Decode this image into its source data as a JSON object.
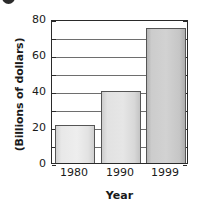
{
  "chart_data": {
    "type": "bar",
    "title": "",
    "xlabel": "Year",
    "ylabel": "(Billions of dollars)",
    "categories": [
      "1980",
      "1990",
      "1999"
    ],
    "values": [
      21,
      40,
      75
    ],
    "ylim": [
      0,
      80
    ],
    "xlim_note": "categorical",
    "y_major_ticks": [
      0,
      20,
      40,
      60,
      80
    ],
    "y_minor_ticks": [
      10,
      30,
      50,
      70
    ],
    "y_tick_labels": [
      "0",
      "20",
      "40",
      "60",
      "80"
    ],
    "gridlines": "horizontal every 10 units",
    "legend": "none",
    "series": [
      {
        "name": "Billions of dollars",
        "values": [
          21,
          40,
          75
        ]
      }
    ],
    "bar_styles": [
      "light-gray",
      "light-gray",
      "medium-gray"
    ]
  },
  "axes": {
    "y_labels": [
      {
        "text": "80",
        "value": 80
      },
      {
        "text": "60",
        "value": 60
      },
      {
        "text": "40",
        "value": 40
      },
      {
        "text": "20",
        "value": 20
      },
      {
        "text": "0",
        "value": 0
      }
    ],
    "y_title": "(Billions of dollars)",
    "x_labels": [
      {
        "text": "1980",
        "value": 21
      },
      {
        "text": "1990",
        "value": 40
      },
      {
        "text": "1999",
        "value": 75
      }
    ],
    "x_title": "Year"
  },
  "marks": {
    "corner_bullet": "bullet-mark"
  }
}
